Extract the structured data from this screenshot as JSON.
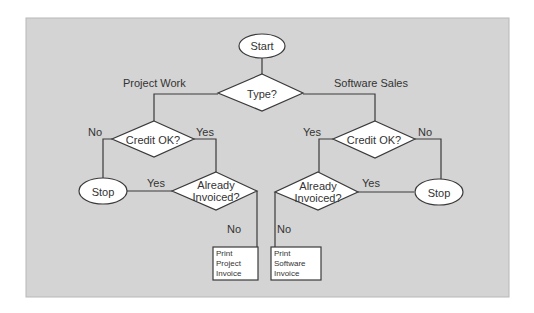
{
  "diagram": {
    "type": "flowchart",
    "colors": {
      "background": "#d4d4d4",
      "shape_fill": "#ffffff",
      "stroke": "#3a3a3a",
      "text": "#333333"
    },
    "nodes": {
      "start": {
        "shape": "oval",
        "label": "Start"
      },
      "type_decision": {
        "shape": "diamond",
        "label": "Type?"
      },
      "credit_left": {
        "shape": "diamond",
        "label": "Credit OK?"
      },
      "credit_right": {
        "shape": "diamond",
        "label": "Credit OK?"
      },
      "stop_left": {
        "shape": "oval",
        "label": "Stop"
      },
      "stop_right": {
        "shape": "oval",
        "label": "Stop"
      },
      "invoiced_left": {
        "shape": "diamond",
        "label_lines": [
          "Already",
          "Invoiced?"
        ]
      },
      "invoiced_right": {
        "shape": "diamond",
        "label_lines": [
          "Already",
          "Invoiced?"
        ]
      },
      "print_project": {
        "shape": "rectangle",
        "label_lines": [
          "Print",
          "Project",
          "Invoice"
        ]
      },
      "print_software": {
        "shape": "rectangle",
        "label_lines": [
          "Print",
          "Software",
          "Invoice"
        ]
      }
    },
    "edge_labels": {
      "project_work": "Project Work",
      "software_sales": "Software Sales",
      "credit_left_no": "No",
      "credit_left_yes": "Yes",
      "credit_right_yes": "Yes",
      "credit_right_no": "No",
      "invoiced_left_yes": "Yes",
      "invoiced_right_yes": "Yes",
      "invoiced_left_no": "No",
      "invoiced_right_no": "No"
    },
    "edges": [
      {
        "from": "start",
        "to": "type_decision"
      },
      {
        "from": "type_decision",
        "to": "credit_left",
        "label": "Project Work"
      },
      {
        "from": "type_decision",
        "to": "credit_right",
        "label": "Software Sales"
      },
      {
        "from": "credit_left",
        "to": "stop_left",
        "label": "No"
      },
      {
        "from": "credit_left",
        "to": "invoiced_left",
        "label": "Yes"
      },
      {
        "from": "credit_right",
        "to": "invoiced_right",
        "label": "Yes"
      },
      {
        "from": "credit_right",
        "to": "stop_right",
        "label": "No"
      },
      {
        "from": "invoiced_left",
        "to": "stop_left",
        "label": "Yes"
      },
      {
        "from": "invoiced_right",
        "to": "stop_right",
        "label": "Yes"
      },
      {
        "from": "invoiced_left",
        "to": "print_project",
        "label": "No"
      },
      {
        "from": "invoiced_right",
        "to": "print_software",
        "label": "No"
      }
    ]
  }
}
